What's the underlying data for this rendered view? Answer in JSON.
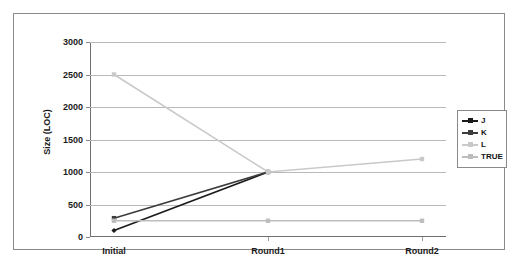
{
  "chart_data": {
    "type": "line",
    "title": "",
    "xlabel": "",
    "ylabel": "Size (LOC)",
    "categories": [
      "Initial",
      "Round1",
      "Round2"
    ],
    "ylim": [
      0,
      3000
    ],
    "yticks": [
      0,
      500,
      1000,
      1500,
      2000,
      2500,
      3000
    ],
    "ytick_labels": [
      "0",
      "500",
      "1000",
      "1500",
      "2000",
      "2500",
      "3000"
    ],
    "grid": true,
    "legend_position": "right",
    "series": [
      {
        "name": "J",
        "values": [
          100,
          1000,
          null
        ],
        "color": "#1a1a1a",
        "marker": "diamond"
      },
      {
        "name": "K",
        "values": [
          290,
          1000,
          null
        ],
        "color": "#3c3c3c",
        "marker": "square"
      },
      {
        "name": "L",
        "values": [
          2500,
          1000,
          1200
        ],
        "color": "#c9c9c9",
        "marker": "square"
      },
      {
        "name": "TRUE",
        "values": [
          250,
          250,
          250
        ],
        "color": "#bdbdbd",
        "marker": "square"
      }
    ]
  },
  "legend": {
    "items": [
      {
        "label": "J",
        "color": "#1a1a1a"
      },
      {
        "label": "K",
        "color": "#3c3c3c"
      },
      {
        "label": "L",
        "color": "#c9c9c9"
      },
      {
        "label": "TRUE",
        "color": "#bdbdbd"
      }
    ]
  }
}
